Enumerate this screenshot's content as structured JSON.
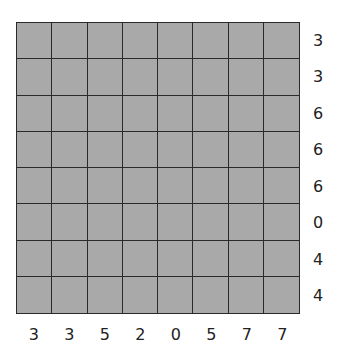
{
  "puzzle": {
    "rows": 8,
    "cols": 8,
    "cell_color": "#a9a9a9",
    "line_color": "#2a2a2a",
    "row_clues": [
      "3",
      "3",
      "6",
      "6",
      "6",
      "0",
      "4",
      "4"
    ],
    "col_clues": [
      "3",
      "3",
      "5",
      "2",
      "0",
      "5",
      "7",
      "7"
    ]
  }
}
